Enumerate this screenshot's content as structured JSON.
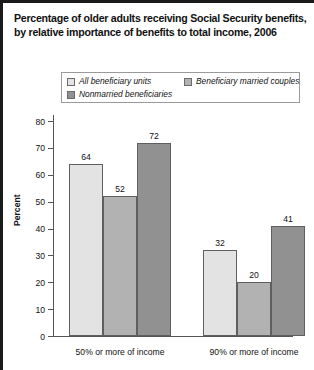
{
  "title": {
    "line1": "Percentage of older adults receiving Social Security benefits,",
    "line2": "by relative importance of benefits to total income, 2006"
  },
  "legend": {
    "items": [
      {
        "label": "All beneficiary units",
        "color": "#e3e3e3"
      },
      {
        "label": "Beneficiary married couples",
        "color": "#b2b2b2"
      },
      {
        "label": "Nonmarried beneficiaries",
        "color": "#919191"
      }
    ]
  },
  "chart_data": {
    "type": "bar",
    "title": "Percentage of older adults receiving Social Security benefits, by relative importance of benefits to total income, 2006",
    "xlabel": "",
    "ylabel": "Percent",
    "ylim": [
      0,
      80
    ],
    "yticks": [
      0,
      10,
      20,
      30,
      40,
      50,
      60,
      70,
      80
    ],
    "ytick_labels": [
      "0",
      "10",
      "20",
      "30",
      "40",
      "50",
      "60",
      "70",
      "80"
    ],
    "grid": false,
    "legend_position": "top",
    "categories": [
      "50% or more of income",
      "90% or more of income"
    ],
    "series": [
      {
        "name": "All beneficiary units",
        "color": "#e3e3e3",
        "values": [
          64,
          32
        ]
      },
      {
        "name": "Beneficiary married couples",
        "color": "#b2b2b2",
        "values": [
          52,
          20
        ]
      },
      {
        "name": "Nonmarried beneficiaries",
        "color": "#919191",
        "values": [
          72,
          41
        ]
      }
    ],
    "data_labels": [
      [
        "64",
        "52",
        "72"
      ],
      [
        "32",
        "20",
        "41"
      ]
    ]
  }
}
